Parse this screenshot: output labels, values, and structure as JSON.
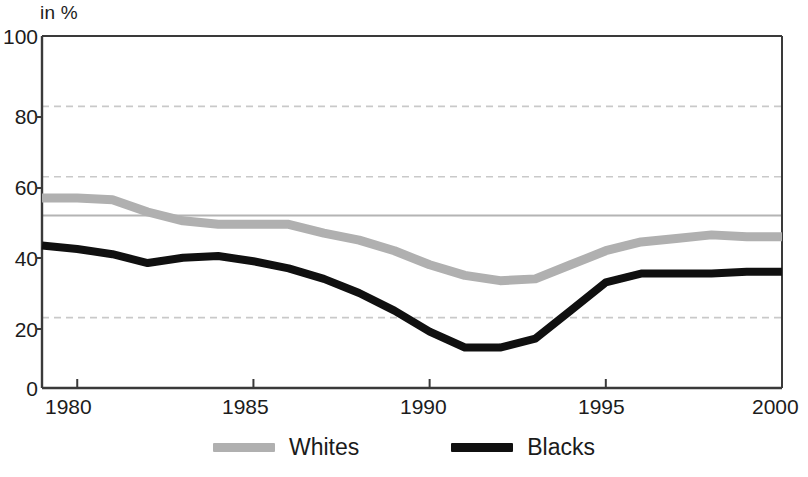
{
  "chart_data": {
    "type": "line",
    "title": "",
    "subtitle": "",
    "unit_label": "in %",
    "xlabel": "",
    "ylabel": "",
    "xlim": [
      1979,
      2000
    ],
    "ylim": [
      0,
      100
    ],
    "grid": "horizontal dashed gridlines at 20, 60 and 80",
    "legend_position": "bottom-center",
    "y_ticks": [
      0,
      20,
      40,
      60,
      80,
      100
    ],
    "y_tick_labels": [
      "0",
      "20",
      "40",
      "60",
      "80",
      "100"
    ],
    "x_ticks": [
      1980,
      1985,
      1990,
      1995,
      2000
    ],
    "x_tick_labels": [
      "1980",
      "1985",
      "1990",
      "1995",
      "2000"
    ],
    "reference_line": {
      "label": "",
      "value": 49,
      "color": "#b4b4b4"
    },
    "x": [
      1979,
      1980,
      1981,
      1982,
      1983,
      1984,
      1985,
      1986,
      1987,
      1988,
      1989,
      1990,
      1991,
      1992,
      1993,
      1994,
      1995,
      1996,
      1997,
      1998,
      1999,
      2000
    ],
    "series": [
      {
        "name": "Whites",
        "color": "#b0b0b0",
        "values": [
          54,
          54,
          53.5,
          50,
          47.5,
          46.5,
          46.5,
          46.5,
          44,
          42,
          39,
          35,
          32,
          30.5,
          31,
          35,
          39,
          41.5,
          42.5,
          43.5,
          43,
          43
        ]
      },
      {
        "name": "Blacks",
        "color": "#101010",
        "values": [
          40.5,
          39.5,
          38,
          35.5,
          37,
          37.5,
          36,
          34,
          31,
          27,
          22,
          16,
          11.5,
          11.5,
          14,
          22,
          30,
          32.5,
          32.5,
          32.5,
          33,
          33
        ]
      }
    ]
  },
  "axis": {
    "unit_label": "in %",
    "y_tick_labels": [
      "100",
      "80",
      "60",
      "40",
      "20",
      "0"
    ],
    "x_tick_labels": [
      "1980",
      "1985",
      "1990",
      "1995",
      "2000"
    ]
  },
  "legend": {
    "items": [
      {
        "label": "Whites",
        "color": "#b0b0b0"
      },
      {
        "label": "Blacks",
        "color": "#101010"
      }
    ]
  }
}
